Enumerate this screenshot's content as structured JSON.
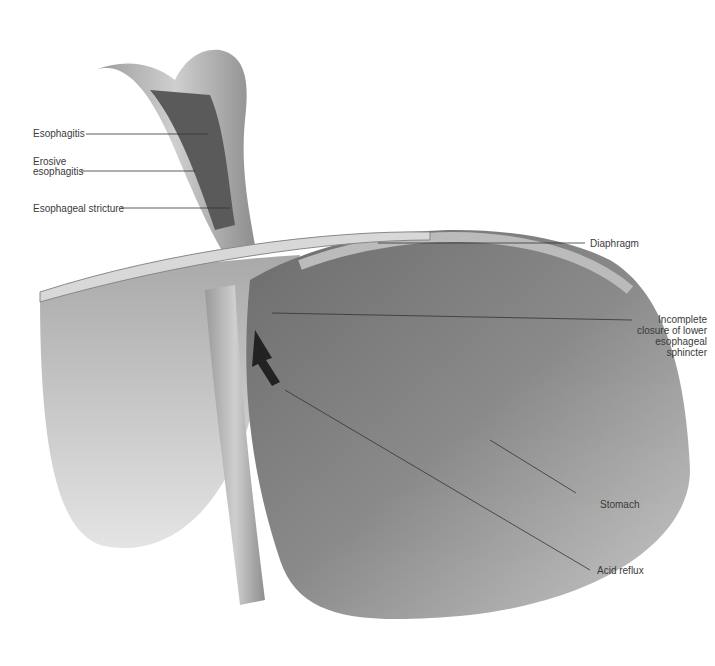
{
  "diagram": {
    "labels": {
      "esophagitis": "Esophagitis",
      "erosive_1": "Erosive",
      "erosive_2": "esophagitis",
      "stricture": "Esophageal stricture",
      "diaphragm": "Diaphragm",
      "les_1": "Incomplete",
      "les_2": "closure of lower",
      "les_3": "esophageal",
      "les_4": "sphincter",
      "stomach": "Stomach",
      "acid_reflux": "Acid reflux"
    }
  }
}
